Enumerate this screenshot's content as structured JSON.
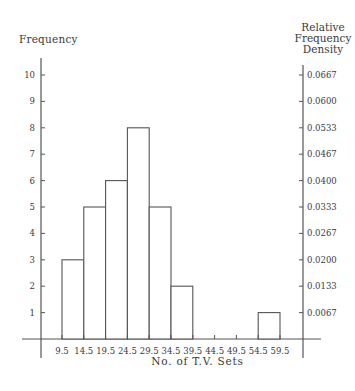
{
  "chart_data": {
    "type": "bar",
    "subtype": "histogram",
    "title": "",
    "xlabel": "No. of T.V. Sets",
    "ylabel": "Frequency",
    "ylabel_right": "Relative Frequency Density",
    "class_boundaries": [
      9.5,
      14.5,
      19.5,
      24.5,
      29.5,
      34.5,
      39.5,
      44.5,
      49.5,
      54.5,
      59.5
    ],
    "categories": [
      "9.5-14.5",
      "14.5-19.5",
      "19.5-24.5",
      "24.5-29.5",
      "29.5-34.5",
      "34.5-39.5",
      "39.5-44.5",
      "44.5-49.5",
      "49.5-54.5",
      "54.5-59.5"
    ],
    "values": [
      3,
      5,
      6,
      8,
      5,
      2,
      0,
      0,
      0,
      1
    ],
    "ylim": [
      0,
      10
    ],
    "left_ticks": [
      "1",
      "2",
      "3",
      "4",
      "5",
      "6",
      "7",
      "8",
      "9",
      "10"
    ],
    "right_ticks": [
      "0.0067",
      "0.0133",
      "0.0200",
      "0.0267",
      "0.0333",
      "0.0400",
      "0.0467",
      "0.0533",
      "0.0600",
      "0.0667"
    ],
    "x_tick_labels": [
      "9.5",
      "14.5",
      "19.5",
      "24.5",
      "29.5",
      "34.5",
      "39.5",
      "44.5",
      "49.5",
      "54.5",
      "59.5"
    ],
    "grid": false,
    "legend": null
  },
  "labels": {
    "left_axis_title": "Frequency",
    "right_axis_title_lines": [
      "Relative",
      "Frequency",
      "Density"
    ],
    "x_axis_title": "No. of T.V. Sets"
  }
}
